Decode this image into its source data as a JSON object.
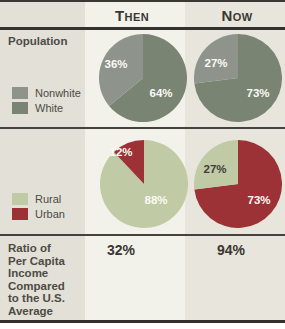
{
  "header": {
    "then": "Then",
    "now": "Now"
  },
  "sections": {
    "population": {
      "label": "Population",
      "legend": [
        {
          "label": "Nonwhite",
          "color": "#8e948b"
        },
        {
          "label": "White",
          "color": "#798472"
        }
      ]
    },
    "residence": {
      "legend": [
        {
          "label": "Rural",
          "color": "#c0caa5"
        },
        {
          "label": "Urban",
          "color": "#9c3236"
        }
      ]
    },
    "income": {
      "label": "Ratio of\nPer Capita\nIncome\nCompared\nto the U.S.\nAverage",
      "then_value": "32%",
      "now_value": "94%"
    }
  },
  "chart_data": [
    {
      "type": "pie",
      "title": "Population (Then)",
      "labels": [
        "Nonwhite",
        "White"
      ],
      "values": [
        36,
        64
      ],
      "colors": [
        "#8e948b",
        "#798472"
      ],
      "value_labels": [
        "36%",
        "64%"
      ],
      "legend_position": "left"
    },
    {
      "type": "pie",
      "title": "Population (Now)",
      "labels": [
        "Nonwhite",
        "White"
      ],
      "values": [
        27,
        73
      ],
      "colors": [
        "#8e948b",
        "#798472"
      ],
      "value_labels": [
        "27%",
        "73%"
      ],
      "legend_position": "left"
    },
    {
      "type": "pie",
      "title": "Rural vs. Urban (Then)",
      "labels": [
        "Urban",
        "Rural"
      ],
      "values": [
        12,
        88
      ],
      "colors": [
        "#9c3236",
        "#c0caa5"
      ],
      "value_labels": [
        "12%",
        "88%"
      ],
      "legend_position": "left"
    },
    {
      "type": "pie",
      "title": "Rural vs. Urban (Now)",
      "labels": [
        "Rural",
        "Urban"
      ],
      "values": [
        27,
        73
      ],
      "colors": [
        "#c0caa5",
        "#9c3236"
      ],
      "value_labels": [
        "27%",
        "73%"
      ],
      "legend_position": "left"
    }
  ],
  "style": {
    "label_column_bg": "#e2e0d7",
    "then_column_bg": "#f2f1ea",
    "now_column_bg": "#e7e5dc",
    "line_color": "#3a3833",
    "text_color": "#4d4b45"
  }
}
